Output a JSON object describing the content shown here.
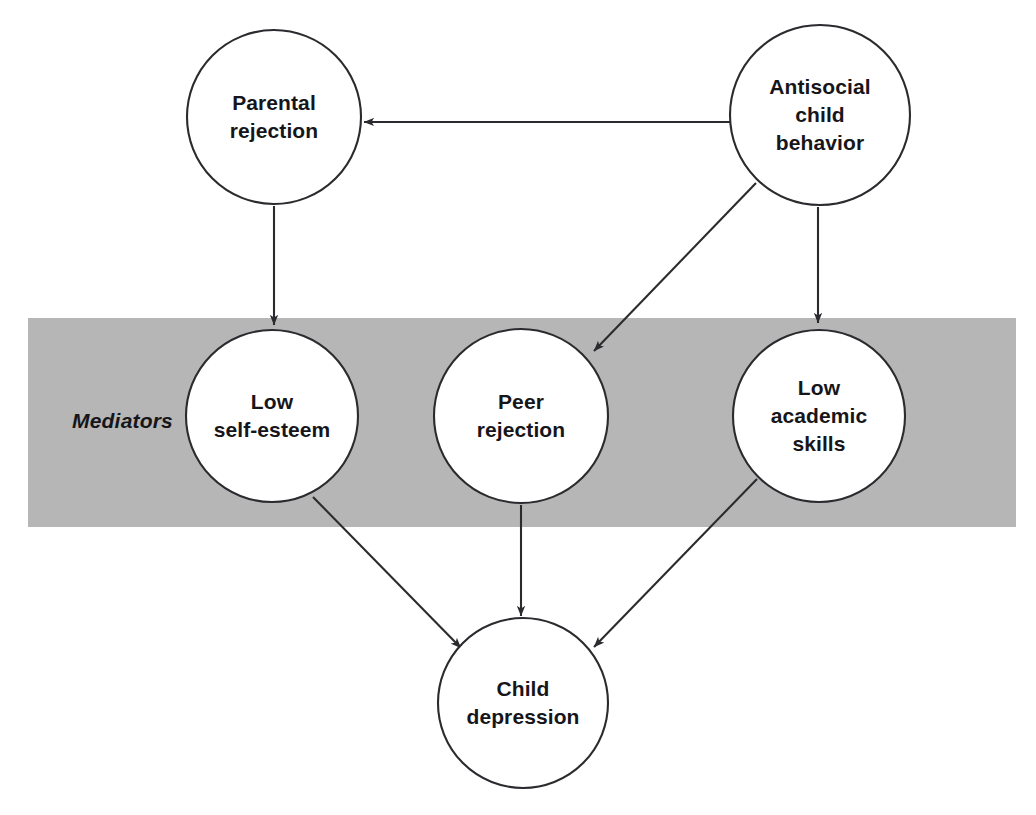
{
  "figure": {
    "background_color": "#ffffff",
    "stroke_color": "#2b2b2f",
    "text_color": "#16161a",
    "band_color": "#b6b6b6"
  },
  "band": {
    "label": "Mediators",
    "label_x": 72,
    "label_y": 421,
    "x": 28,
    "y": 318,
    "width": 988,
    "height": 209,
    "fill": "#b6b6b6"
  },
  "nodes": [
    {
      "id": "parental-rejection",
      "label": "Parental\nrejection",
      "cx": 274,
      "cy": 117,
      "r": 87,
      "fill": "#ffffff"
    },
    {
      "id": "antisocial-child-behavior",
      "label": "Antisocial\nchild\nbehavior",
      "cx": 820,
      "cy": 115,
      "r": 90,
      "fill": "#ffffff"
    },
    {
      "id": "low-self-esteem",
      "label": "Low\nself-esteem",
      "cx": 272,
      "cy": 416,
      "r": 86,
      "fill": "#ffffff"
    },
    {
      "id": "peer-rejection",
      "label": "Peer\nrejection",
      "cx": 521,
      "cy": 416,
      "r": 87,
      "fill": "#ffffff"
    },
    {
      "id": "low-academic-skills",
      "label": "Low\nacademic\nskills",
      "cx": 819,
      "cy": 416,
      "r": 86,
      "fill": "#ffffff"
    },
    {
      "id": "child-depression",
      "label": "Child\ndepression",
      "cx": 523,
      "cy": 703,
      "r": 85,
      "fill": "#ffffff"
    }
  ],
  "edges": [
    {
      "id": "antisocial-to-parental-rejection",
      "from": "antisocial-child-behavior",
      "to": "parental-rejection",
      "x1": 730,
      "y1": 122,
      "x2": 364,
      "y2": 122
    },
    {
      "id": "antisocial-to-peer-rejection",
      "from": "antisocial-child-behavior",
      "to": "peer-rejection",
      "x1": 756,
      "y1": 183,
      "x2": 594,
      "y2": 351
    },
    {
      "id": "antisocial-to-low-academic-skills",
      "from": "antisocial-child-behavior",
      "to": "low-academic-skills",
      "x1": 818,
      "y1": 207,
      "x2": 818,
      "y2": 323
    },
    {
      "id": "parental-rejection-to-low-self-esteem",
      "from": "parental-rejection",
      "to": "low-self-esteem",
      "x1": 274,
      "y1": 206,
      "x2": 274,
      "y2": 325
    },
    {
      "id": "low-self-esteem-to-child-depression",
      "from": "low-self-esteem",
      "to": "child-depression",
      "x1": 313,
      "y1": 497,
      "x2": 461,
      "y2": 648
    },
    {
      "id": "peer-rejection-to-child-depression",
      "from": "peer-rejection",
      "to": "child-depression",
      "x1": 521,
      "y1": 505,
      "x2": 521,
      "y2": 616
    },
    {
      "id": "low-academic-skills-to-child-depression",
      "from": "low-academic-skills",
      "to": "child-depression",
      "x1": 757,
      "y1": 479,
      "x2": 594,
      "y2": 647
    }
  ]
}
